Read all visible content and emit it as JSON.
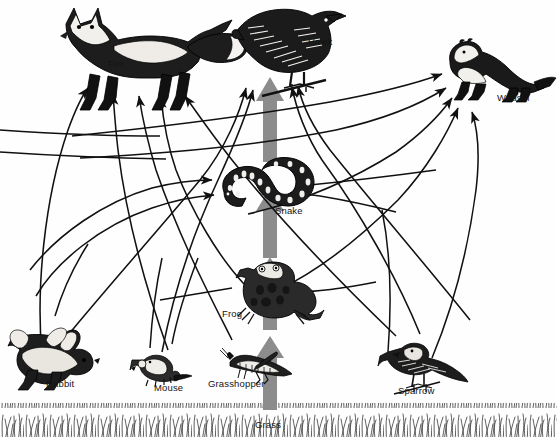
{
  "diagram": {
    "type": "food-web",
    "background_color": "#fefefe",
    "line_color": "#111111",
    "energy_arrow_color": "#8c8c8c",
    "label_color": "#141414"
  },
  "organisms": [
    {
      "id": "fox",
      "label": "Fox",
      "label_x": 108,
      "label_y": 58,
      "x": 45,
      "y": 8,
      "trophic": "tertiary consumer"
    },
    {
      "id": "hawk",
      "label": "Hawk",
      "label_x": 308,
      "label_y": 36,
      "x": 228,
      "y": 2,
      "trophic": "tertiary consumer"
    },
    {
      "id": "weasel",
      "label": "Weasel",
      "label_x": 497,
      "label_y": 92,
      "x": 438,
      "y": 34,
      "trophic": "tertiary consumer"
    },
    {
      "id": "snake",
      "label": "Snake",
      "label_x": 275,
      "label_y": 205,
      "x": 218,
      "y": 152,
      "trophic": "secondary consumer"
    },
    {
      "id": "frog",
      "label": "Frog",
      "label_x": 222,
      "label_y": 308,
      "x": 238,
      "y": 257,
      "trophic": "secondary consumer"
    },
    {
      "id": "rabbit",
      "label": "Rabbit",
      "label_x": 46,
      "label_y": 378,
      "x": 8,
      "y": 322,
      "trophic": "primary consumer"
    },
    {
      "id": "mouse",
      "label": "Mouse",
      "label_x": 154,
      "label_y": 382,
      "x": 133,
      "y": 350,
      "trophic": "primary consumer"
    },
    {
      "id": "grasshopper",
      "label": "Grasshopper",
      "label_x": 208,
      "label_y": 378,
      "x": 228,
      "y": 347,
      "trophic": "primary consumer"
    },
    {
      "id": "sparrow",
      "label": "Sparrow",
      "label_x": 398,
      "label_y": 385,
      "x": 382,
      "y": 340,
      "trophic": "primary consumer"
    },
    {
      "id": "grass",
      "label": "Grass",
      "label_x": 255,
      "label_y": 419,
      "x": 0,
      "y": 402,
      "trophic": "producer"
    }
  ],
  "energy_arrows": [
    {
      "id": "grass-to-grasshopper",
      "from": "grass",
      "to": "grasshopper",
      "x": 270,
      "y_top": 338,
      "y_bottom": 410
    },
    {
      "id": "grasshopper-to-frog",
      "from": "grasshopper",
      "to": "frog",
      "x": 270,
      "y_top": 258,
      "y_bottom": 330
    },
    {
      "id": "frog-to-snake",
      "from": "frog",
      "to": "snake",
      "x": 270,
      "y_top": 188,
      "y_bottom": 258
    },
    {
      "id": "snake-to-hawk",
      "from": "snake",
      "to": "hawk",
      "x": 270,
      "y_top": 78,
      "y_bottom": 162
    }
  ],
  "feeding_links": [
    {
      "id": "rabbit-to-fox",
      "from": "rabbit",
      "to": "fox"
    },
    {
      "id": "mouse-to-fox",
      "from": "mouse",
      "to": "fox"
    },
    {
      "id": "grasshopper-to-fox",
      "from": "grasshopper",
      "to": "fox"
    },
    {
      "id": "sparrow-to-fox",
      "from": "sparrow",
      "to": "fox"
    },
    {
      "id": "frog-to-fox",
      "from": "frog",
      "to": "fox"
    },
    {
      "id": "mouse-to-hawk",
      "from": "mouse",
      "to": "hawk"
    },
    {
      "id": "rabbit-to-hawk",
      "from": "rabbit",
      "to": "hawk"
    },
    {
      "id": "sparrow-to-hawk",
      "from": "sparrow",
      "to": "hawk"
    },
    {
      "id": "frog-to-hawk",
      "from": "frog",
      "to": "hawk"
    },
    {
      "id": "mouse-to-weasel",
      "from": "mouse",
      "to": "weasel"
    },
    {
      "id": "rabbit-to-weasel",
      "from": "rabbit",
      "to": "weasel"
    },
    {
      "id": "grasshopper-to-weasel",
      "from": "grasshopper",
      "to": "weasel"
    },
    {
      "id": "sparrow-to-weasel",
      "from": "sparrow",
      "to": "weasel"
    },
    {
      "id": "frog-to-weasel",
      "from": "frog",
      "to": "weasel"
    },
    {
      "id": "mouse-to-snake",
      "from": "mouse",
      "to": "snake"
    },
    {
      "id": "grasshopper-to-snake",
      "from": "grasshopper",
      "to": "snake"
    },
    {
      "id": "sparrow-to-snake",
      "from": "sparrow",
      "to": "snake"
    },
    {
      "id": "grasshopper-to-frog-link",
      "from": "grasshopper",
      "to": "frog"
    }
  ]
}
